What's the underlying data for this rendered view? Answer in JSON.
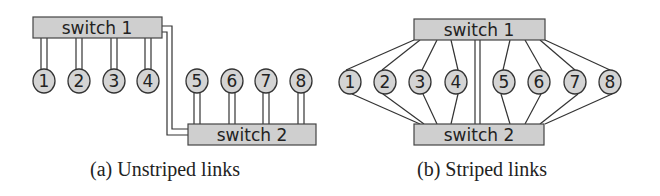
{
  "figures": [
    {
      "id": "a",
      "caption": "(a) Unstriped links",
      "switch1": {
        "label": "switch 1"
      },
      "switch2": {
        "label": "switch 2"
      },
      "nodes": [
        "1",
        "2",
        "3",
        "4",
        "5",
        "6",
        "7",
        "8"
      ],
      "description": "Nodes 1-4 attach to switch 1 with double links; nodes 5-8 attach to switch 2 with double links; switch 1 and switch 2 joined by a double inter-switch link."
    },
    {
      "id": "b",
      "caption": "(b) Striped links",
      "switch1": {
        "label": "switch 1"
      },
      "switch2": {
        "label": "switch 2"
      },
      "nodes": [
        "1",
        "2",
        "3",
        "4",
        "5",
        "6",
        "7",
        "8"
      ],
      "description": "Every node 1-8 has one link to switch 1 and one link to switch 2; switch 1 and switch 2 joined by a double link in the middle."
    }
  ]
}
